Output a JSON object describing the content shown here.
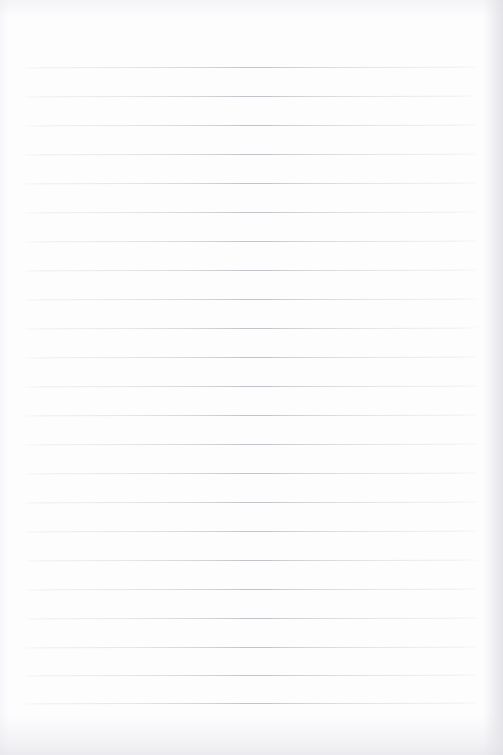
{
  "document": {
    "kind": "scanned-ruled-paper",
    "title": "Blank Ruled Notebook Page",
    "content_text": "",
    "has_handwriting": false,
    "has_printed_text": false,
    "has_margin_rule": false,
    "page_width_px": 503,
    "page_height_px": 755
  },
  "colors": {
    "page_background": "#fdfdfe",
    "rule_line": "#c3c3c9",
    "rule_halo": "#c8c8d0",
    "edge_shadow": "#e2e2e7"
  },
  "ruling": {
    "line_count": 23,
    "first_line_y": 67,
    "spacing_px": 29.0,
    "line_thickness_px": 1,
    "line_left_x": 25,
    "line_right_x": 477,
    "line_length_px": 452,
    "skew_degrees": -0.12,
    "top_margin_px": 67,
    "bottom_margin_px": 52,
    "left_margin_px": 25,
    "right_margin_px": 26,
    "lines_y": [
      67,
      96,
      125,
      154,
      183,
      212,
      241,
      270,
      299,
      328,
      357,
      386,
      415,
      444,
      473,
      502,
      531,
      560,
      589,
      618,
      647,
      675,
      703
    ]
  }
}
